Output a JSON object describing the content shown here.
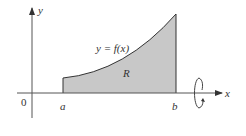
{
  "diagram": {
    "type": "solid-of-revolution-region",
    "axes": {
      "x_label": "x",
      "y_label": "y",
      "origin_label": "0"
    },
    "points": {
      "a_label": "a",
      "b_label": "b"
    },
    "curve_label": "y = f(x)",
    "region_label": "R",
    "rotation_axis": "x",
    "colors": {
      "region_fill": "#c8c8c8",
      "axis": "#555555",
      "curve": "#333333"
    }
  }
}
